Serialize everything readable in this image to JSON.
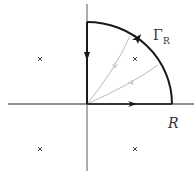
{
  "diagram": {
    "labels": {
      "gamma": "Γ",
      "gamma_sub": "R",
      "radius": "R"
    },
    "poles": [
      {
        "quadrant": "upper-left"
      },
      {
        "quadrant": "upper-right"
      },
      {
        "quadrant": "lower-left"
      },
      {
        "quadrant": "lower-right"
      }
    ],
    "colors": {
      "contour": "#1a1a1a",
      "axis": "#222222",
      "vertical_axis": "#888888",
      "rays": "#bbbbbb"
    }
  }
}
